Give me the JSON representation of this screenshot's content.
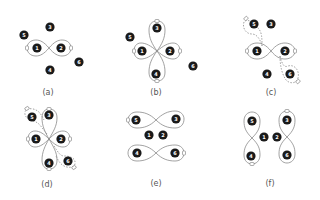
{
  "figure": {
    "panels": [
      {
        "id": "a",
        "label": "(a)",
        "nodes": [
          {
            "n": "1",
            "x": 37,
            "y": 48
          },
          {
            "n": "2",
            "x": 61,
            "y": 48
          },
          {
            "n": "3",
            "x": 50,
            "y": 27
          },
          {
            "n": "4",
            "x": 50,
            "y": 70
          },
          {
            "n": "5",
            "x": 24,
            "y": 35
          },
          {
            "n": "6",
            "x": 79,
            "y": 62
          }
        ]
      },
      {
        "id": "b",
        "label": "(b)",
        "nodes": [
          {
            "n": "1",
            "x": 142,
            "y": 51
          },
          {
            "n": "2",
            "x": 170,
            "y": 51
          },
          {
            "n": "3",
            "x": 157,
            "y": 28
          },
          {
            "n": "4",
            "x": 156,
            "y": 74
          },
          {
            "n": "5",
            "x": 130,
            "y": 37
          },
          {
            "n": "6",
            "x": 193,
            "y": 66
          }
        ]
      },
      {
        "id": "c",
        "label": "(c)",
        "nodes": [
          {
            "n": "1",
            "x": 257,
            "y": 51
          },
          {
            "n": "2",
            "x": 285,
            "y": 51
          },
          {
            "n": "3",
            "x": 271,
            "y": 24
          },
          {
            "n": "4",
            "x": 267,
            "y": 74
          },
          {
            "n": "5",
            "x": 254,
            "y": 24
          },
          {
            "n": "6",
            "x": 290,
            "y": 74
          }
        ]
      },
      {
        "id": "d",
        "label": "(d)",
        "nodes": [
          {
            "n": "1",
            "x": 36,
            "y": 139
          },
          {
            "n": "2",
            "x": 61,
            "y": 139
          },
          {
            "n": "3",
            "x": 49,
            "y": 115
          },
          {
            "n": "4",
            "x": 49,
            "y": 163
          },
          {
            "n": "5",
            "x": 32,
            "y": 117
          },
          {
            "n": "6",
            "x": 68,
            "y": 161
          }
        ]
      },
      {
        "id": "e",
        "label": "(e)",
        "nodes": [
          {
            "n": "1",
            "x": 149,
            "y": 135
          },
          {
            "n": "2",
            "x": 163,
            "y": 135
          },
          {
            "n": "3",
            "x": 176,
            "y": 119
          },
          {
            "n": "4",
            "x": 137,
            "y": 153
          },
          {
            "n": "5",
            "x": 136,
            "y": 120
          },
          {
            "n": "6",
            "x": 175,
            "y": 153
          }
        ]
      },
      {
        "id": "f",
        "label": "(f)",
        "nodes": [
          {
            "n": "1",
            "x": 264,
            "y": 137
          },
          {
            "n": "2",
            "x": 277,
            "y": 137
          },
          {
            "n": "3",
            "x": 287,
            "y": 120
          },
          {
            "n": "4",
            "x": 251,
            "y": 156
          },
          {
            "n": "5",
            "x": 252,
            "y": 121
          },
          {
            "n": "6",
            "x": 287,
            "y": 155
          }
        ]
      }
    ]
  }
}
